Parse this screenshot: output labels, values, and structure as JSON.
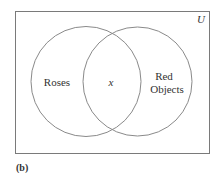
{
  "diagram": {
    "type": "venn",
    "universe_label": "U",
    "sets": [
      {
        "name": "roses",
        "label": "Roses"
      },
      {
        "name": "red-objects",
        "label_lines": [
          "Red",
          "Objects"
        ]
      }
    ],
    "intersection_label": "x",
    "caption": "(b)",
    "colors": {
      "outline": "#8a8a8a",
      "frame": "#7a7a7a",
      "text": "#333333"
    }
  }
}
